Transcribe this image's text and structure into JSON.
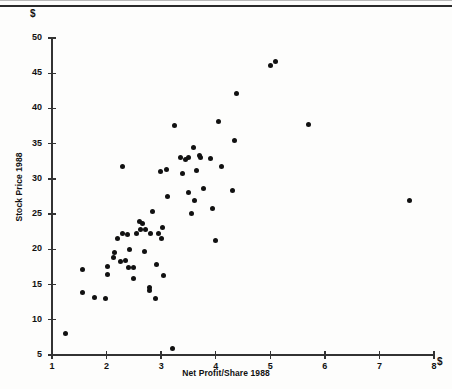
{
  "figure": {
    "y_unit_symbol": "$",
    "x_unit_symbol": "$",
    "x_axis_label": "Net Profit/Share 1988",
    "y_axis_label": "Stock Price 1988"
  },
  "chart_data": {
    "type": "scatter",
    "title": "",
    "xlabel": "Net Profit/Share 1988",
    "ylabel": "Stock Price 1988",
    "x_unit": "$",
    "y_unit": "$",
    "xlim": [
      1,
      8
    ],
    "ylim": [
      5,
      50
    ],
    "xticks": [
      1,
      2,
      3,
      4,
      5,
      6,
      7,
      8
    ],
    "yticks": [
      5,
      10,
      15,
      20,
      25,
      30,
      35,
      40,
      45,
      50
    ],
    "xtick_labels": [
      "1",
      "2",
      "3",
      "4",
      "5",
      "6",
      "7",
      "8"
    ],
    "ytick_labels": [
      "5",
      "10",
      "15",
      "20",
      "25",
      "30",
      "35",
      "40",
      "45",
      "50"
    ],
    "grid": false,
    "legend": null,
    "marker": "filled-circle",
    "marker_color": "#111111",
    "points": [
      [
        1.25,
        8.0
      ],
      [
        1.55,
        13.9
      ],
      [
        1.55,
        17.2
      ],
      [
        1.78,
        13.2
      ],
      [
        1.98,
        13.0
      ],
      [
        2.02,
        16.4
      ],
      [
        2.02,
        17.5
      ],
      [
        2.12,
        18.9
      ],
      [
        2.15,
        19.6
      ],
      [
        2.2,
        21.6
      ],
      [
        2.25,
        18.3
      ],
      [
        2.3,
        22.3
      ],
      [
        2.3,
        31.7
      ],
      [
        2.35,
        18.4
      ],
      [
        2.38,
        22.1
      ],
      [
        2.4,
        17.4
      ],
      [
        2.42,
        20.0
      ],
      [
        2.5,
        15.8
      ],
      [
        2.5,
        17.4
      ],
      [
        2.55,
        22.3
      ],
      [
        2.6,
        24.0
      ],
      [
        2.62,
        22.8
      ],
      [
        2.65,
        23.6
      ],
      [
        2.7,
        19.7
      ],
      [
        2.72,
        22.8
      ],
      [
        2.78,
        14.6
      ],
      [
        2.78,
        14.1
      ],
      [
        2.8,
        22.2
      ],
      [
        2.85,
        25.4
      ],
      [
        2.9,
        13.0
      ],
      [
        2.92,
        17.8
      ],
      [
        2.95,
        22.3
      ],
      [
        2.98,
        31.0
      ],
      [
        3.0,
        21.5
      ],
      [
        3.02,
        23.1
      ],
      [
        3.05,
        16.3
      ],
      [
        3.1,
        31.4
      ],
      [
        3.12,
        27.5
      ],
      [
        3.2,
        5.9
      ],
      [
        3.25,
        37.6
      ],
      [
        3.35,
        33.0
      ],
      [
        3.4,
        30.7
      ],
      [
        3.45,
        32.8
      ],
      [
        3.5,
        28.0
      ],
      [
        3.5,
        33.1
      ],
      [
        3.55,
        25.1
      ],
      [
        3.6,
        34.5
      ],
      [
        3.62,
        27.0
      ],
      [
        3.65,
        31.2
      ],
      [
        3.7,
        33.3
      ],
      [
        3.72,
        33.0
      ],
      [
        3.78,
        28.7
      ],
      [
        3.9,
        32.9
      ],
      [
        3.95,
        25.8
      ],
      [
        4.0,
        21.3
      ],
      [
        4.05,
        38.2
      ],
      [
        4.1,
        31.8
      ],
      [
        4.3,
        28.4
      ],
      [
        4.35,
        35.4
      ],
      [
        4.38,
        42.1
      ],
      [
        5.0,
        46.1
      ],
      [
        5.1,
        46.6
      ],
      [
        5.7,
        37.7
      ],
      [
        7.55,
        27.0
      ]
    ]
  }
}
